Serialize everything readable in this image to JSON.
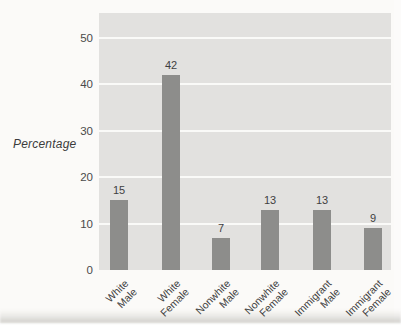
{
  "chart_data": {
    "type": "bar",
    "title": "",
    "xlabel": "",
    "ylabel": "Percentage",
    "categories": [
      "White Male",
      "White Female",
      "Nonwhite Male",
      "Nonwhite Female",
      "Immigrant Male",
      "Immigrant Female"
    ],
    "category_lines": [
      [
        "White",
        "Male"
      ],
      [
        "White",
        "Female"
      ],
      [
        "Nonwhite",
        "Male"
      ],
      [
        "Nonwhite",
        "Female"
      ],
      [
        "Immigrant",
        "Male"
      ],
      [
        "Immigrant",
        "Female"
      ]
    ],
    "values": [
      15,
      42,
      7,
      13,
      13,
      9
    ],
    "bar_value_labels": [
      "15",
      "42",
      "7",
      "13",
      "13",
      "9"
    ],
    "yticks": [
      0,
      10,
      20,
      30,
      40,
      50
    ],
    "ylim": [
      0,
      55.4
    ],
    "grid": true,
    "legend": "none",
    "colors": {
      "bar": "#8d8d8b",
      "plot_background": "#e2e1df",
      "gridline": "#fbfbf9",
      "text": "#3f3f3f",
      "page_background": "#fbfaf8"
    }
  }
}
